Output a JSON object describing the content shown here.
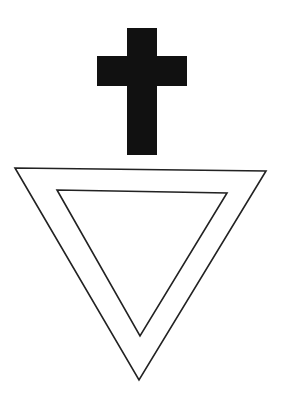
{
  "figure": {
    "background": "#ffffff",
    "ink": "#111111",
    "cross": {
      "icon": "cross-icon",
      "vertical_bar": {
        "x": 127,
        "y": 28,
        "width": 30,
        "height": 127
      },
      "horizontal_bar": {
        "x": 97,
        "y": 56,
        "width": 90,
        "height": 30
      },
      "fill": "#111111"
    },
    "outer_triangle": {
      "icon": "triangle-down-outline-icon",
      "points": "15,168 266,171 139,380",
      "stroke": "#222222",
      "stroke_width": 1.6
    },
    "inner_triangle": {
      "icon": "triangle-down-outline-icon",
      "points": "57,190 227,193 140,336",
      "stroke": "#222222",
      "stroke_width": 1.6
    }
  }
}
